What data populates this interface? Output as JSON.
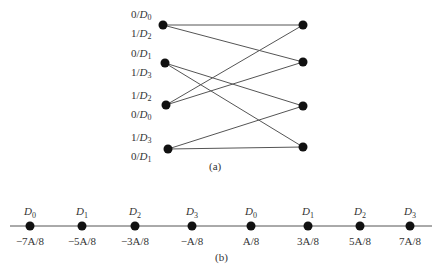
{
  "figure_a": {
    "caption": "(a)",
    "left_nodes": [
      {
        "labels": [
          {
            "bit": "0",
            "sym": "D",
            "sub": "0"
          },
          {
            "bit": "1",
            "sym": "D",
            "sub": "2"
          }
        ]
      },
      {
        "labels": [
          {
            "bit": "0",
            "sym": "D",
            "sub": "1"
          },
          {
            "bit": "1",
            "sym": "D",
            "sub": "3"
          }
        ]
      },
      {
        "labels": [
          {
            "bit": "1",
            "sym": "D",
            "sub": "2"
          },
          {
            "bit": "0",
            "sym": "D",
            "sub": "0"
          }
        ]
      },
      {
        "labels": [
          {
            "bit": "1",
            "sym": "D",
            "sub": "3"
          },
          {
            "bit": "0",
            "sym": "D",
            "sub": "1"
          }
        ]
      }
    ],
    "right_nodes": 4,
    "edges": [
      [
        0,
        0
      ],
      [
        0,
        1
      ],
      [
        1,
        2
      ],
      [
        1,
        3
      ],
      [
        2,
        0
      ],
      [
        2,
        1
      ],
      [
        3,
        2
      ],
      [
        3,
        3
      ]
    ]
  },
  "figure_b": {
    "caption": "(b)",
    "points": [
      {
        "symbol": "D",
        "sub": "0",
        "value": "−7A/8"
      },
      {
        "symbol": "D",
        "sub": "1",
        "value": "−5A/8"
      },
      {
        "symbol": "D",
        "sub": "2",
        "value": "−3A/8"
      },
      {
        "symbol": "D",
        "sub": "3",
        "value": "−A/8"
      },
      {
        "symbol": "D",
        "sub": "0",
        "value": "A/8"
      },
      {
        "symbol": "D",
        "sub": "1",
        "value": "3A/8"
      },
      {
        "symbol": "D",
        "sub": "2",
        "value": "5A/8"
      },
      {
        "symbol": "D",
        "sub": "3",
        "value": "7A/8"
      }
    ]
  }
}
